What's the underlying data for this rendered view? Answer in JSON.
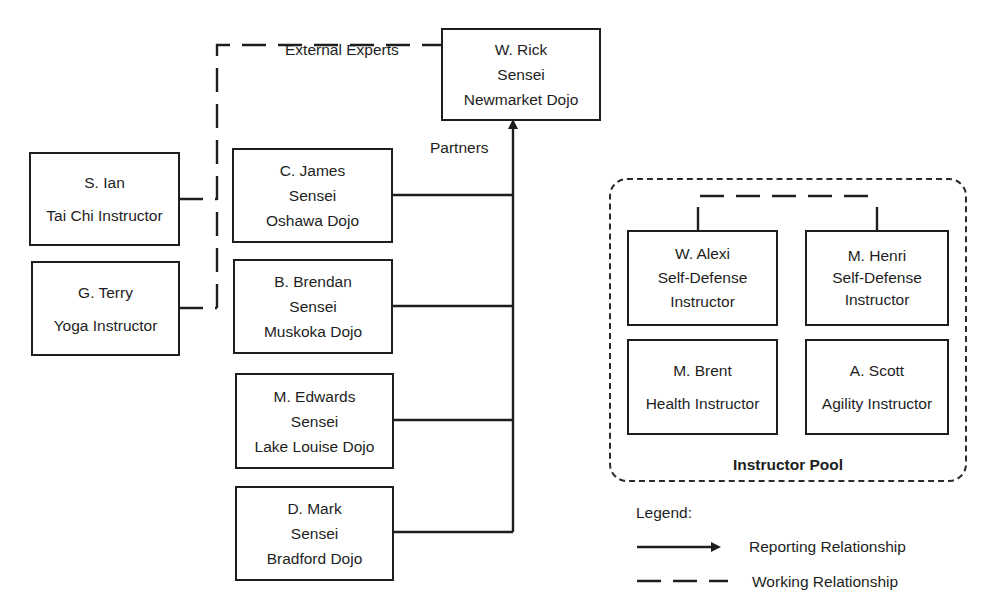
{
  "colors": {
    "line": "#1e1e1e",
    "background": "#ffffff"
  },
  "labels": {
    "external_experts": "External Experts",
    "partners": "Partners"
  },
  "head": {
    "name": "W. Rick",
    "title": "Sensei",
    "org": "Newmarket Dojo"
  },
  "external": [
    {
      "name": "S. Ian",
      "role": "Tai Chi Instructor"
    },
    {
      "name": "G. Terry",
      "role": "Yoga Instructor"
    }
  ],
  "partners": [
    {
      "name": "C. James",
      "title": "Sensei",
      "org": "Oshawa Dojo"
    },
    {
      "name": "B. Brendan",
      "title": "Sensei",
      "org": "Muskoka Dojo"
    },
    {
      "name": "M. Edwards",
      "title": "Sensei",
      "org": "Lake Louise Dojo"
    },
    {
      "name": "D. Mark",
      "title": "Sensei",
      "org": "Bradford Dojo"
    }
  ],
  "pool": {
    "title": "Instructor Pool",
    "members": [
      {
        "name": "W. Alexi",
        "role_line1": "Self-Defense",
        "role_line2": "Instructor"
      },
      {
        "name": "M. Henri",
        "role_line1": "Self-Defense",
        "role_line2": "Instructor"
      },
      {
        "name": "M. Brent",
        "role": "Health Instructor"
      },
      {
        "name": "A. Scott",
        "role": "Agility Instructor"
      }
    ]
  },
  "legend": {
    "title": "Legend:",
    "reporting": "Reporting Relationship",
    "working": "Working Relationship"
  }
}
